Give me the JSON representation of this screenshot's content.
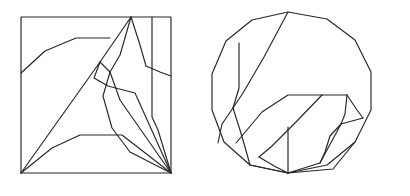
{
  "page": {
    "background_color": "#ffffff",
    "stroke_color": "#262626",
    "stroke_width": 1.15,
    "width": 410,
    "height": 196
  },
  "chart_data": {
    "type": "diagram",
    "figures": [
      {
        "name": "square-figure",
        "label": "Square with internal polylines",
        "boundary": {
          "name": "square-boundary",
          "shape": "rectangle",
          "points": [
            [
              21,
              17
            ],
            [
              171,
              17
            ],
            [
              171,
              173
            ],
            [
              21,
              173
            ],
            [
              21,
              17
            ]
          ]
        },
        "internal_paths": [
          {
            "name": "upper-left-ridge",
            "points": [
              [
                21,
                73
              ],
              [
                45,
                51
              ],
              [
                76,
                38
              ],
              [
                110,
                38
              ]
            ]
          },
          {
            "name": "apex-left-diagonal",
            "points": [
              [
                21,
                173
              ],
              [
                100,
                62
              ],
              [
                131,
                17
              ]
            ]
          },
          {
            "name": "apex-right-slope",
            "points": [
              [
                131,
                17
              ],
              [
                140,
                45
              ],
              [
                146,
                66
              ],
              [
                160,
                72
              ],
              [
                171,
                76
              ]
            ]
          },
          {
            "name": "apex-center-drop",
            "points": [
              [
                131,
                17
              ],
              [
                120,
                55
              ],
              [
                110,
                72
              ],
              [
                103,
                96
              ],
              [
                112,
                128
              ],
              [
                130,
                152
              ],
              [
                171,
                173
              ]
            ]
          },
          {
            "name": "mid-left-wedge",
            "points": [
              [
                100,
                62
              ],
              [
                94,
                78
              ],
              [
                108,
                86
              ],
              [
                135,
                93
              ],
              [
                171,
                173
              ]
            ]
          },
          {
            "name": "mid-short-strut",
            "points": [
              [
                100,
                62
              ],
              [
                110,
                72
              ],
              [
                120,
                100
              ],
              [
                171,
                173
              ]
            ]
          },
          {
            "name": "lower-left-ridge",
            "points": [
              [
                21,
                173
              ],
              [
                52,
                148
              ],
              [
                80,
                135
              ],
              [
                122,
                135
              ],
              [
                171,
                173
              ]
            ]
          },
          {
            "name": "right-vertical-rib",
            "points": [
              [
                152,
                17
              ],
              [
                152,
                117
              ],
              [
                158,
                130
              ],
              [
                171,
                173
              ]
            ]
          }
        ]
      },
      {
        "name": "circle-figure",
        "label": "Circular polygon with internal polylines",
        "boundary": {
          "name": "circle-boundary",
          "shape": "polygon-circle",
          "points": [
            [
              288,
              12
            ],
            [
              327,
              19
            ],
            [
              355,
              40
            ],
            [
              371,
              72
            ],
            [
              371,
              110
            ],
            [
              355,
              142
            ],
            [
              327,
              165
            ],
            [
              288,
              173
            ],
            [
              250,
              165
            ],
            [
              224,
              142
            ],
            [
              212,
              110
            ],
            [
              212,
              74
            ],
            [
              226,
              41
            ],
            [
              252,
              20
            ],
            [
              288,
              12
            ]
          ]
        },
        "internal_paths": [
          {
            "name": "main-diagonal-upper",
            "points": [
              [
                288,
                12
              ],
              [
                264,
                57
              ],
              [
                243,
                93
              ],
              [
                233,
                108
              ]
            ]
          },
          {
            "name": "main-diagonal-lower",
            "points": [
              [
                233,
                108
              ],
              [
                222,
                124
              ],
              [
                218,
                143
              ]
            ]
          },
          {
            "name": "left-vertical-rib",
            "points": [
              [
                239,
                43
              ],
              [
                239,
                88
              ],
              [
                233,
                108
              ]
            ]
          },
          {
            "name": "left-lower-rib",
            "points": [
              [
                233,
                108
              ],
              [
                240,
                130
              ],
              [
                245,
                147
              ],
              [
                250,
                165
              ]
            ]
          },
          {
            "name": "inner-upper-left-edge",
            "points": [
              [
                236,
                143
              ],
              [
                262,
                112
              ],
              [
                288,
                95
              ],
              [
                322,
                95
              ]
            ]
          },
          {
            "name": "inner-top-horizontal",
            "points": [
              [
                322,
                95
              ],
              [
                347,
                95
              ]
            ]
          },
          {
            "name": "inner-right-peak",
            "points": [
              [
                347,
                95
              ],
              [
                357,
                110
              ],
              [
                363,
                118
              ]
            ]
          },
          {
            "name": "inner-right-rib",
            "points": [
              [
                347,
                95
              ],
              [
                345,
                114
              ],
              [
                341,
                124
              ]
            ]
          },
          {
            "name": "inner-second-diagonal",
            "points": [
              [
                322,
                95
              ],
              [
                296,
                122
              ],
              [
                272,
                146
              ],
              [
                259,
                157
              ]
            ]
          },
          {
            "name": "inner-lower-right-edge",
            "points": [
              [
                363,
                118
              ],
              [
                341,
                124
              ],
              [
                330,
                136
              ],
              [
                325,
                152
              ],
              [
                320,
                163
              ]
            ]
          },
          {
            "name": "inner-bottom-fan-a",
            "points": [
              [
                259,
                157
              ],
              [
                276,
                167
              ],
              [
                288,
                173
              ]
            ]
          },
          {
            "name": "inner-bottom-fan-b",
            "points": [
              [
                288,
                173
              ],
              [
                320,
                163
              ],
              [
                341,
                124
              ]
            ]
          },
          {
            "name": "bottom-vertical-rib",
            "points": [
              [
                288,
                127
              ],
              [
                288,
                173
              ]
            ]
          },
          {
            "name": "lower-left-tie",
            "points": [
              [
                250,
                165
              ],
              [
                288,
                173
              ]
            ]
          },
          {
            "name": "lower-mid-tie",
            "points": [
              [
                288,
                173
              ],
              [
                333,
                169
              ],
              [
                355,
                142
              ]
            ]
          }
        ]
      }
    ]
  }
}
